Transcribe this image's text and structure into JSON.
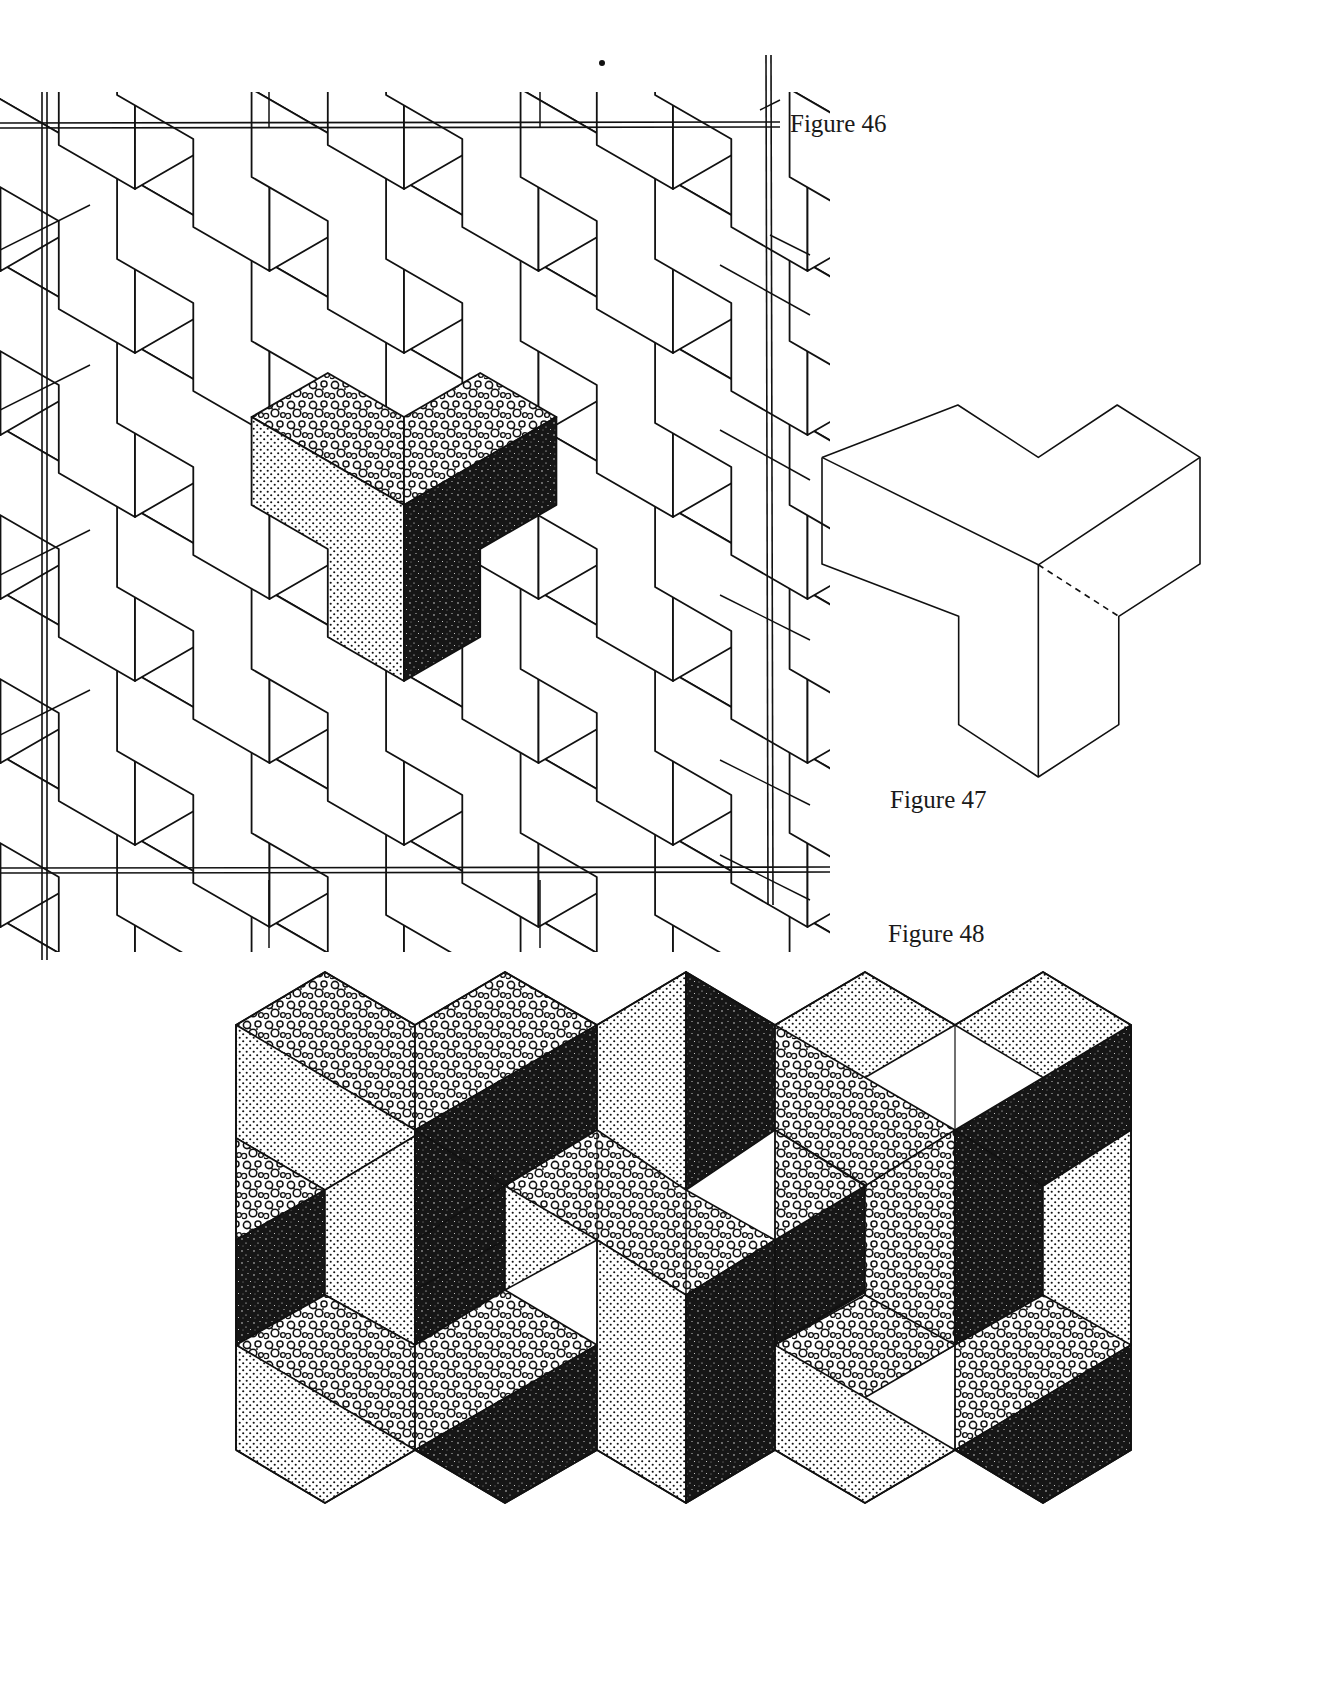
{
  "page": {
    "background": "#ffffff",
    "ink": "#111111"
  },
  "figures": [
    {
      "id": "figure-46",
      "caption": "Figure 46",
      "description": "Tessellation of isometric Y-shaped tiles inside a double-ruled square frame; one tile is shaded with three textures",
      "shaded_tile": {
        "top_left_face": "coarse-bubble",
        "top_right_face": "coarse-bubble",
        "left_face": "fine-dot",
        "right_face": "dark-speckle"
      }
    },
    {
      "id": "figure-47",
      "caption": "Figure 47",
      "description": "Single isometric Y-shaped tile outline with one dashed hidden edge"
    },
    {
      "id": "figure-48",
      "caption": "Figure 48",
      "description": "Tessellation of Y-shaped tiles rendered with three textures (coarse bubble, fine dot, dark speckle) giving a 3D block illusion",
      "textures": [
        "coarse-bubble",
        "fine-dot",
        "dark-speckle"
      ]
    }
  ]
}
